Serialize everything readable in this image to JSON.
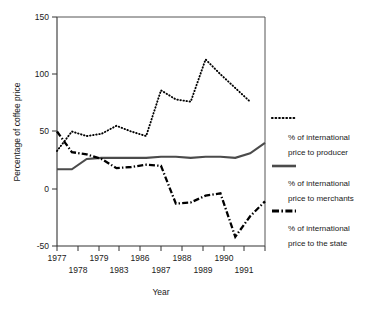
{
  "chart_data": {
    "type": "line",
    "title": "",
    "xlabel": "Year",
    "ylabel": "Percentage of coffee price",
    "x": [
      1977,
      1978,
      1979,
      1980,
      1981,
      1982,
      1983,
      1984,
      1985,
      1986,
      1987,
      1988,
      1989,
      1990,
      1991
    ],
    "xlim": [
      1977,
      1991
    ],
    "ylim": [
      -50,
      150
    ],
    "yticks": [
      -50,
      0,
      50,
      100,
      150
    ],
    "ytick_labels": [
      "-50",
      "0",
      "50",
      "100",
      "150"
    ],
    "xtick_labels_upper": [
      "1977",
      "1979",
      "1986",
      "1988",
      "1990"
    ],
    "xtick_labels_lower": [
      "1978",
      "1983",
      "1987",
      "1989",
      "1991"
    ],
    "xtick_values_upper": [
      1977,
      1979,
      1983,
      1987,
      1989
    ],
    "xtick_values_lower": [
      1978,
      1981,
      1985,
      1988,
      1990
    ],
    "grid": false,
    "legend_position": "right",
    "series": [
      {
        "name": "% of international price to producer",
        "style": "dotted",
        "values": [
          33,
          50,
          46,
          48,
          55,
          50,
          46,
          86,
          78,
          76,
          113,
          100,
          88,
          76,
          null
        ]
      },
      {
        "name": "% of international price to merchants",
        "style": "solid",
        "values": [
          17,
          17,
          26,
          27,
          27,
          27,
          27,
          28,
          28,
          27,
          28,
          28,
          27,
          31,
          40
        ]
      },
      {
        "name": "% of international price to the state",
        "style": "dash-dot",
        "values": [
          50,
          32,
          30,
          26,
          18,
          19,
          21,
          20,
          -13,
          -12,
          -6,
          -4,
          -42,
          -24,
          -11
        ]
      }
    ]
  },
  "legend": {
    "entries": [
      {
        "line1": "% of international",
        "line2": "price to producer",
        "key": "dotted"
      },
      {
        "line1": "% of international",
        "line2": "price to merchants",
        "key": "solid"
      },
      {
        "line1": "% of international",
        "line2": "price to the state",
        "key": "dash-dot"
      }
    ]
  },
  "axis": {
    "y_title": "Percentage of coffee price",
    "x_title": "Year",
    "y_ticks": [
      "150",
      "100",
      "50",
      "0",
      "-50"
    ],
    "x_ticks_row1": [
      "1977",
      "1979",
      "1986",
      "1988",
      "1990"
    ],
    "x_ticks_row2": [
      "1978",
      "1983",
      "1987",
      "1989",
      "1991"
    ]
  },
  "colors": {
    "axis": "#333333",
    "producer": "#000000",
    "merchants": "#4b4b4b",
    "state": "#000000",
    "background": "#ffffff"
  }
}
